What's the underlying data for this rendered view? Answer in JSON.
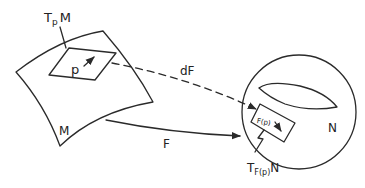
{
  "diagram": {
    "type": "differential-map",
    "colors": {
      "ink": "#2a2a2a",
      "background": "#ffffff"
    },
    "labels": {
      "tangent_space_M": {
        "main": "T",
        "sub": "p",
        "rest": "M"
      },
      "point": "p",
      "manifold_M": "M",
      "map": "F",
      "differential": "dF",
      "manifold_N": "N",
      "image_point": "F(p)",
      "tangent_space_N": {
        "main": "T",
        "sub": "F(p)",
        "rest": "N"
      }
    },
    "nodes": [
      {
        "id": "M",
        "label": "M",
        "shape": "curved-surface-patch"
      },
      {
        "id": "TpM",
        "label": "TpM",
        "shape": "parallelogram",
        "parent": "M"
      },
      {
        "id": "N",
        "label": "N",
        "shape": "circle-with-arc"
      },
      {
        "id": "TFpN",
        "label": "TF(p)N",
        "shape": "rotated-rectangle",
        "parent": "N"
      }
    ],
    "edges": [
      {
        "from": "M",
        "to": "N",
        "label": "F",
        "style": "solid-arrow"
      },
      {
        "from": "TpM",
        "to": "TFpN",
        "label": "dF",
        "style": "dashed-arrow"
      }
    ]
  }
}
